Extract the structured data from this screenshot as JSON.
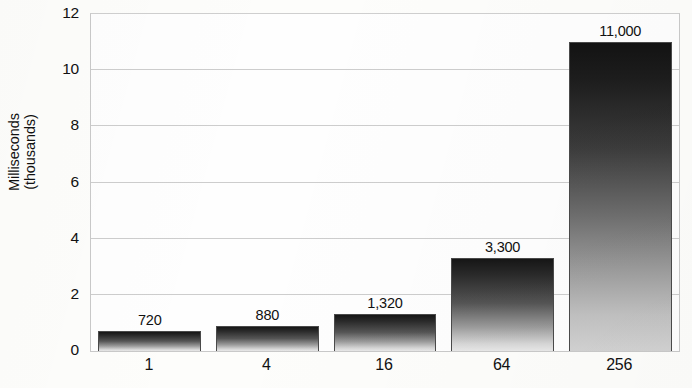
{
  "chart_data": {
    "type": "bar",
    "title": "",
    "xlabel": "",
    "ylabel": "Milliseconds (thousands)",
    "ylabel_lines": [
      "Milliseconds",
      "(thousands)"
    ],
    "categories": [
      "1",
      "4",
      "16",
      "64",
      "256"
    ],
    "values": [
      0.72,
      0.88,
      1.32,
      3.3,
      11
    ],
    "data_labels": [
      "720",
      "880",
      "1,320",
      "3,300",
      "11,000"
    ],
    "ylim": [
      0,
      12
    ],
    "y_ticks": [
      0,
      2,
      4,
      6,
      8,
      10,
      12
    ],
    "y_tick_labels": [
      "0",
      "2",
      "4",
      "6",
      "8",
      "10",
      "12"
    ],
    "grid": true,
    "grid_axis": "y",
    "legend": false,
    "legend_position": "none",
    "series": [
      {
        "name": "Milliseconds (thousands)",
        "values": [
          0.72,
          0.88,
          1.32,
          3.3,
          11
        ]
      }
    ],
    "bar_fill": "vertical-gradient-dark-to-light",
    "colors": {
      "bar_top": "#161616",
      "bar_bottom": "#e8e8e8",
      "gridline": "#cdcdcd",
      "axis": "#c9c9c9",
      "text": "#111111",
      "background": "#fdfdfb"
    }
  }
}
